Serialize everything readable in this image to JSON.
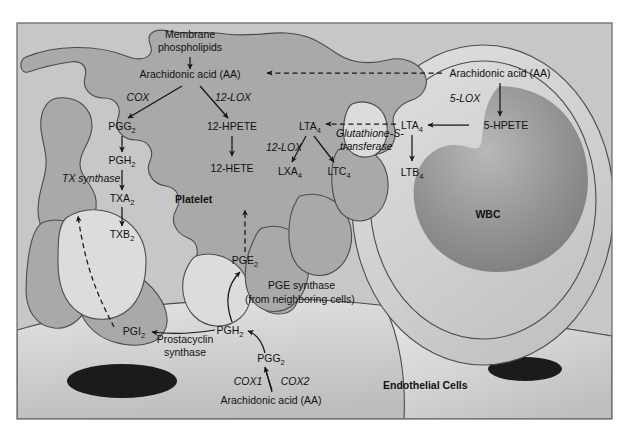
{
  "figure": {
    "frame_border_color": "#6d6d72",
    "background_color": "#c7c7c7"
  },
  "cells": {
    "platelet": {
      "name": "Platelet",
      "fill_color": "#a9a9a9"
    },
    "wbc": {
      "name": "WBC",
      "fill_color": "#cfcfcf",
      "nucleus_color": "#8e8e8e"
    },
    "endothelial": {
      "name": "Endothelial Cells",
      "fill_color": "#d0d0d0",
      "nucleus_color": "#1b1b1b"
    }
  },
  "metabolites": {
    "membrane_phospholipids_l1": "Membrane",
    "membrane_phospholipids_l2": "phospholipids",
    "aa_platelet": "Arachidonic acid (AA)",
    "aa_wbc": "Arachidonic acid (AA)",
    "aa_endothelial": "Arachidonic acid (AA)",
    "pgg2_platelet": "PGG",
    "pgg2_platelet_sub": "2",
    "pgh2_platelet": "PGH",
    "pgh2_platelet_sub": "2",
    "txa2": "TXA",
    "txa2_sub": "2",
    "txb2": "TXB",
    "txb2_sub": "2",
    "hpete12": "12-HPETE",
    "hete12": "12-HETE",
    "lta4_platelet": "LTA",
    "lta4_platelet_sub": "4",
    "lxa4": "LXA",
    "lxa4_sub": "4",
    "ltc4": "LTC",
    "ltc4_sub": "4",
    "lta4_wbc": "LTA",
    "lta4_wbc_sub": "4",
    "hpete5": "5-HPETE",
    "ltb4": "LTB",
    "ltb4_sub": "4",
    "pge2": "PGE",
    "pge2_sub": "2",
    "pgi2": "PGI",
    "pgi2_sub": "2",
    "pgh2_endothelial": "PGH",
    "pgh2_endothelial_sub": "2",
    "pgg2_endothelial": "PGG",
    "pgg2_endothelial_sub": "2"
  },
  "enzymes": {
    "cox": "COX",
    "lox12_upper": "12-LOX",
    "lox12_lower": "12-LOX",
    "tx_synthase": "TX synthase",
    "lox5": "5-LOX",
    "glutathione_l1": "Glutathione-S-",
    "glutathione_l2": "transferase",
    "pge_synthase_l1": "PGE synthase",
    "pge_synthase_l2": "(from neighboring cells)",
    "prostacyclin_synthase_l1": "Prostacyclin",
    "prostacyclin_synthase_l2": "synthase",
    "cox1": "COX1",
    "cox2": "COX2"
  }
}
